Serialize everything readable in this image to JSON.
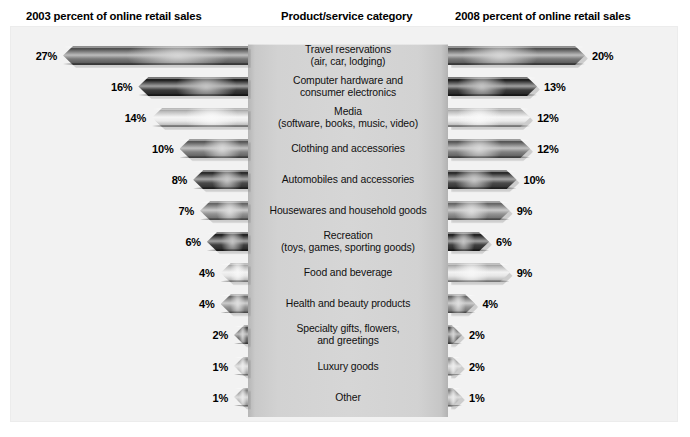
{
  "header": {
    "left_title": "2003 percent of online retail sales",
    "center_title": "Product/service category",
    "right_title": "2008 percent of online retail sales"
  },
  "chart_data": {
    "type": "bar",
    "title": "",
    "subtitle": "",
    "orientation": "horizontal-bidirectional",
    "grid": false,
    "legend_position": "none",
    "xlabel": "percent of online retail sales",
    "ylabel": "Product/service category",
    "xlim": [
      0,
      27
    ],
    "unit": "%",
    "categories": [
      "Travel reservations\n(air, car, lodging)",
      "Computer hardware and\nconsumer electronics",
      "Media\n(software, books, music, video)",
      "Clothing and accessories",
      "Automobiles and accessories",
      "Housewares and household goods",
      "Recreation\n(toys, games, sporting goods)",
      "Food and beverage",
      "Health and beauty products",
      "Specialty gifts, flowers,\nand greetings",
      "Luxury goods",
      "Other"
    ],
    "category_lines": [
      [
        "Travel reservations",
        "(air, car, lodging)"
      ],
      [
        "Computer hardware and",
        "consumer electronics"
      ],
      [
        "Media",
        "(software, books, music, video)"
      ],
      [
        "Clothing and accessories",
        ""
      ],
      [
        "Automobiles and accessories",
        ""
      ],
      [
        "Housewares and household goods",
        ""
      ],
      [
        "Recreation",
        "(toys, games, sporting goods)"
      ],
      [
        "Food and beverage",
        ""
      ],
      [
        "Health and beauty products",
        ""
      ],
      [
        "Specialty gifts, flowers,",
        "and greetings"
      ],
      [
        "Luxury goods",
        ""
      ],
      [
        "Other",
        ""
      ]
    ],
    "series": [
      {
        "name": "2003 percent of online retail sales",
        "side": "left",
        "values": [
          27,
          16,
          14,
          10,
          8,
          7,
          6,
          4,
          4,
          2,
          1,
          1
        ],
        "labels": [
          "27%",
          "16%",
          "14%",
          "10%",
          "8%",
          "7%",
          "6%",
          "4%",
          "4%",
          "2%",
          "1%",
          "1%"
        ]
      },
      {
        "name": "2008 percent of online retail sales",
        "side": "right",
        "values": [
          20,
          13,
          12,
          12,
          10,
          9,
          6,
          9,
          4,
          2,
          2,
          1
        ],
        "labels": [
          "20%",
          "13%",
          "12%",
          "12%",
          "10%",
          "9%",
          "6%",
          "9%",
          "4%",
          "2%",
          "2%",
          "1%"
        ]
      }
    ],
    "bar_colors": [
      "#6d6d6d",
      "#2b2b2b",
      "#e8e8e8",
      "#767676",
      "#3b3b3b",
      "#8a8a8a",
      "#2e2e2e",
      "#e4e4e4",
      "#8d8d8d",
      "#6a6a6a",
      "#c0c0c0",
      "#b4b4b4"
    ]
  },
  "colors": {
    "page_background": "#ffffff",
    "plate_background": "#f2f2f2",
    "center_panel": "#d4d4d4",
    "text": "#000000"
  }
}
